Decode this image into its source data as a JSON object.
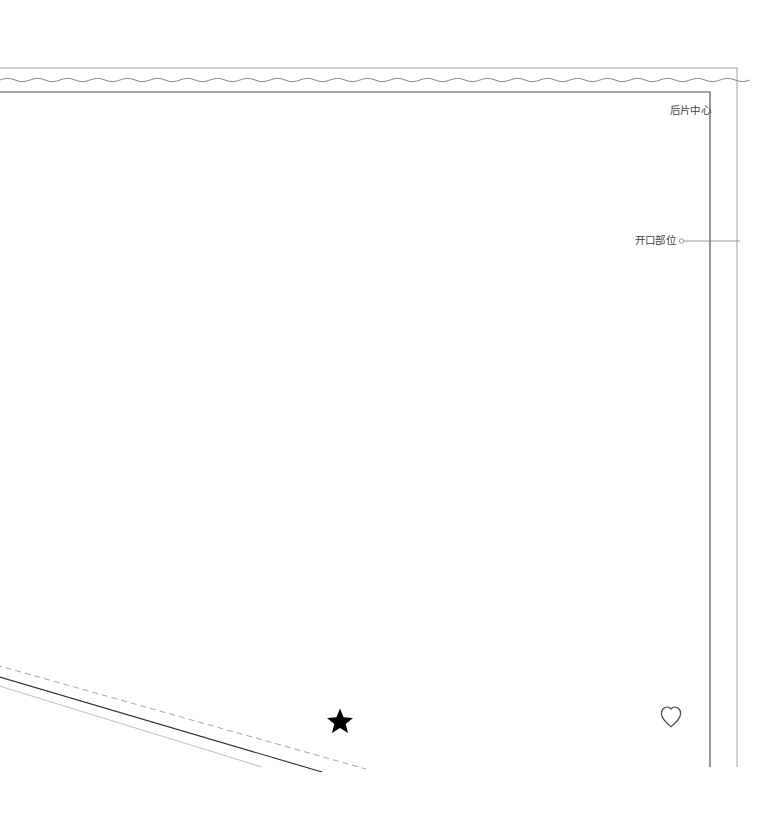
{
  "document": {
    "type": "garment-pattern-technical-drawing",
    "background_color": "#ffffff"
  },
  "labels": {
    "back_center": "后片中心",
    "opening_position": "开口部位"
  },
  "markers": {
    "star": {
      "name": "star-marker",
      "glyph": "★",
      "fill": "#000000",
      "x": 340,
      "y": 720,
      "size": 25
    },
    "heart": {
      "name": "heart-marker",
      "glyph": "♡",
      "stroke": "#3f3f42",
      "x": 671,
      "y": 716,
      "size": 22
    }
  },
  "colors": {
    "outline_dark": "#4a4a4d",
    "outline_mid": "#6e6e72",
    "outline_light": "#a8a8ad",
    "wave_line": "#7a7a7e",
    "text": "#3f3f42"
  },
  "geometry": {
    "outer_frame": {
      "top_y": 68,
      "right_x": 737,
      "bottom_y": 767
    },
    "inner_frame": {
      "top_y": 92,
      "right_x": 710,
      "bottom_y": 767
    },
    "wave": {
      "y": 80,
      "amplitude": 3.2,
      "period": 30,
      "x_start": 0,
      "x_end": 737
    },
    "opening_leader": {
      "y": 241,
      "x_start": 681,
      "x_end": 740,
      "dot_radius": 2.2
    },
    "diagonals": [
      {
        "name": "dashed-seam-line",
        "style": "dashed",
        "x1": 0,
        "y1": 666,
        "x2": 366,
        "y2": 769
      },
      {
        "name": "solid-hem-line",
        "style": "solid-dark",
        "x1": 0,
        "y1": 677,
        "x2": 322,
        "y2": 772
      },
      {
        "name": "light-guide-line",
        "style": "solid-light",
        "x1": 0,
        "y1": 686,
        "x2": 262,
        "y2": 767
      }
    ]
  }
}
